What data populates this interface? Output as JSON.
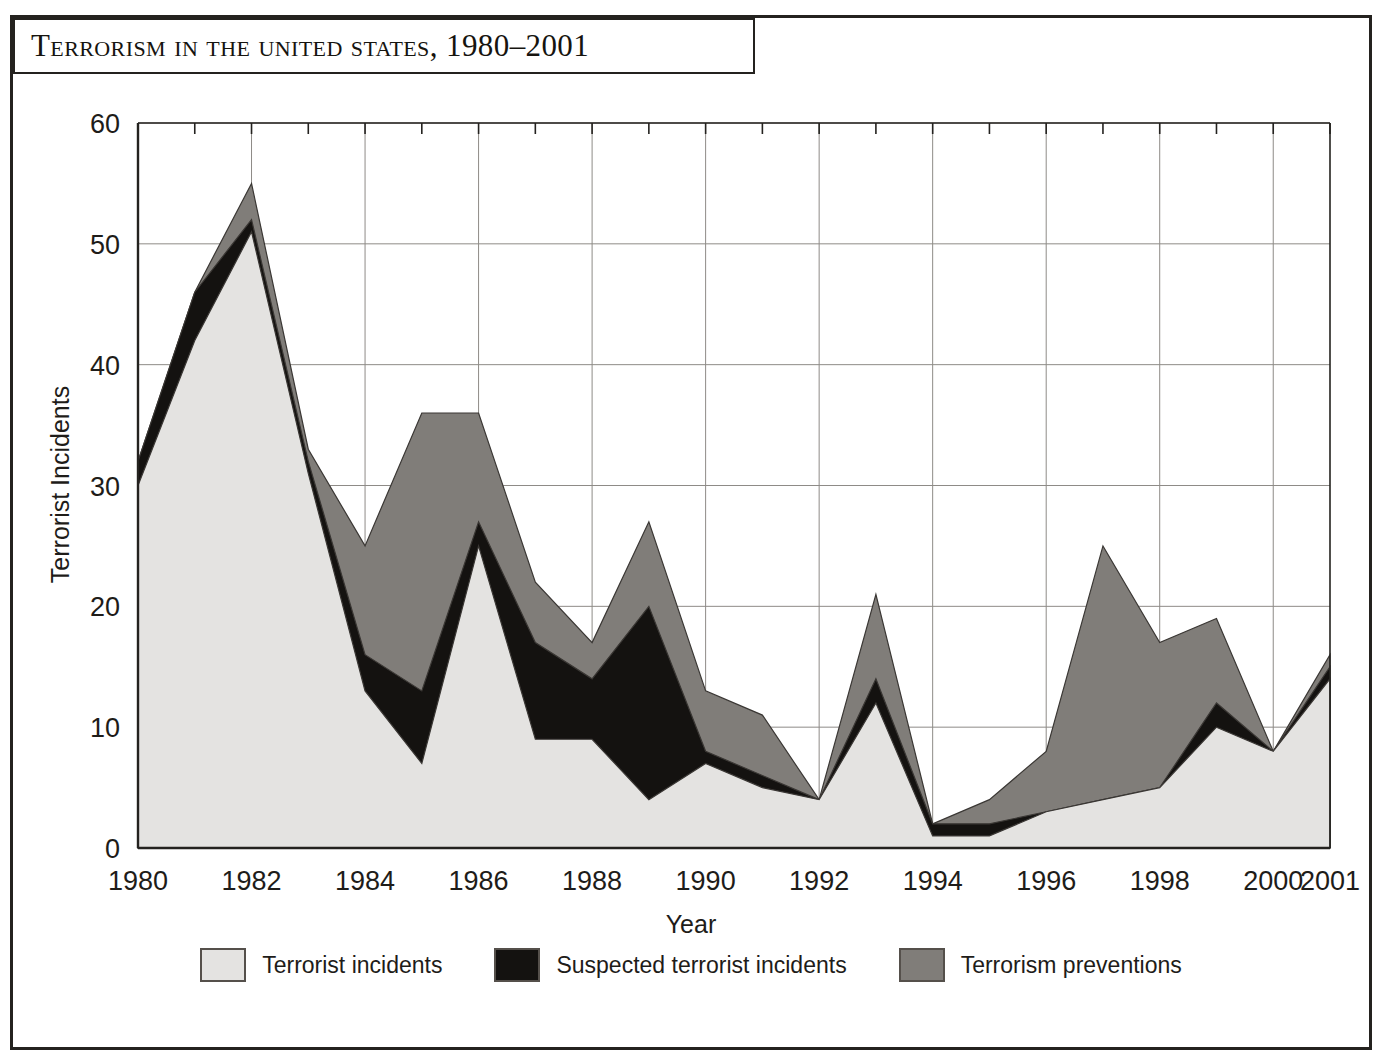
{
  "header": {
    "title": "Terrorism in the United States, 1980–2001"
  },
  "chart_data": {
    "type": "area",
    "stacked": true,
    "title": "Terrorism in the United States, 1980–2001",
    "xlabel": "Year",
    "ylabel": "Terrorist Incidents",
    "ylim": [
      0,
      60
    ],
    "yticks": [
      0,
      10,
      20,
      30,
      40,
      50,
      60
    ],
    "ytick_labels": [
      "0",
      "10",
      "20",
      "30",
      "40",
      "50",
      "60"
    ],
    "xlim": [
      1980,
      2001
    ],
    "x": [
      1980,
      1981,
      1982,
      1983,
      1984,
      1985,
      1986,
      1987,
      1988,
      1989,
      1990,
      1991,
      1992,
      1993,
      1994,
      1995,
      1996,
      1997,
      1998,
      1999,
      2000,
      2001
    ],
    "xticks": [
      1980,
      1982,
      1984,
      1986,
      1988,
      1990,
      1992,
      1994,
      1996,
      1998,
      2000,
      2001
    ],
    "xtick_labels": [
      "1980",
      "1982",
      "1984",
      "1986",
      "1988",
      "1990",
      "1992",
      "1994",
      "1996",
      "1998",
      "2000",
      "2001"
    ],
    "grid": true,
    "legend_position": "bottom",
    "series": [
      {
        "name": "Terrorist incidents",
        "color": "#e4e3e1",
        "values": [
          30,
          42,
          51,
          31,
          13,
          7,
          25,
          9,
          9,
          4,
          7,
          5,
          4,
          12,
          1,
          1,
          3,
          4,
          5,
          10,
          8,
          14
        ]
      },
      {
        "name": "Suspected terrorist incidents",
        "color": "#141210",
        "values": [
          2,
          4,
          1,
          1,
          3,
          6,
          2,
          8,
          5,
          16,
          1,
          1,
          0,
          2,
          1,
          1,
          0,
          0,
          0,
          2,
          0,
          1
        ]
      },
      {
        "name": "Terrorism preventions",
        "color": "#807d79",
        "values": [
          0,
          0,
          3,
          1,
          9,
          23,
          9,
          5,
          3,
          7,
          5,
          5,
          0,
          7,
          0,
          2,
          5,
          21,
          12,
          7,
          0,
          1
        ]
      }
    ],
    "totals": [
      32,
      46,
      55,
      33,
      25,
      36,
      36,
      22,
      17,
      27,
      13,
      11,
      4,
      21,
      2,
      4,
      8,
      25,
      17,
      19,
      8,
      16
    ]
  },
  "legend": {
    "items": [
      {
        "label": "Terrorist incidents",
        "swatch": "#e4e3e1"
      },
      {
        "label": "Suspected terrorist incidents",
        "swatch": "#141210"
      },
      {
        "label": "Terrorism preventions",
        "swatch": "#807d79"
      }
    ]
  },
  "colors": {
    "frame": "#24221f",
    "grid": "#8e8b87",
    "axis": "#24221f",
    "text": "#1e1c19"
  }
}
